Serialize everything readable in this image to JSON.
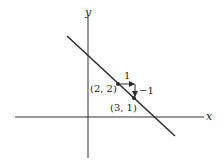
{
  "axes": {
    "x_label": "x",
    "y_label": "y"
  },
  "line": {
    "equation": "y = -x + 4",
    "slope": -1
  },
  "points": [
    {
      "label": "(2, 2)",
      "x": 2,
      "y": 2
    },
    {
      "label": "(3, 1)",
      "x": 3,
      "y": 1
    }
  ],
  "slope_triangle": {
    "run_label": "1",
    "rise_label": "−1"
  },
  "colors": {
    "ink": "#2a2a2a",
    "background": "#ffffff"
  }
}
